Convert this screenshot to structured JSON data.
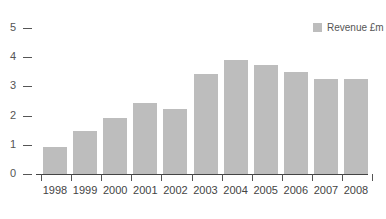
{
  "chart_data": {
    "type": "bar",
    "title": "",
    "xlabel": "",
    "ylabel": "",
    "categories": [
      "1998",
      "1999",
      "2000",
      "2001",
      "2002",
      "2003",
      "2004",
      "2005",
      "2006",
      "2007",
      "2008"
    ],
    "series": [
      {
        "name": "Revenue £m",
        "color": "#bdbdbd",
        "values": [
          0.92,
          1.47,
          1.92,
          2.43,
          2.22,
          3.42,
          3.9,
          3.73,
          3.49,
          3.27,
          3.27
        ]
      }
    ],
    "ylim": [
      0,
      5
    ],
    "yticks": [
      0,
      1,
      2,
      3,
      4,
      5
    ],
    "grid": false,
    "legend_position": "top-right"
  },
  "legend": {
    "label": "Revenue £m"
  }
}
